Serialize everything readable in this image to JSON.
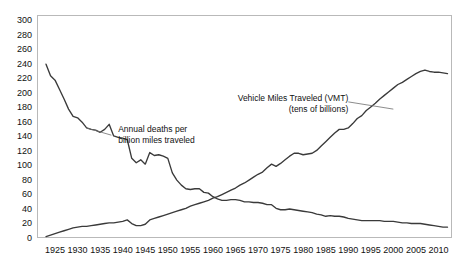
{
  "chart_data": {
    "type": "line",
    "title": "",
    "subtitle": "",
    "xlabel": "",
    "ylabel": "",
    "xlim": [
      1921,
      2013
    ],
    "ylim": [
      0,
      308
    ],
    "y_ticks": [
      0,
      20,
      40,
      60,
      80,
      100,
      120,
      140,
      160,
      180,
      200,
      220,
      240,
      260,
      280,
      300
    ],
    "x_ticks": [
      1925,
      1930,
      1935,
      1940,
      1945,
      1950,
      1955,
      1960,
      1965,
      1970,
      1975,
      1980,
      1985,
      1990,
      1995,
      2000,
      2005,
      2010
    ],
    "grid": false,
    "legend_position": "inline-annotations",
    "line_color": "#3a3a3a",
    "frame_color": "#b9b9b9",
    "background": "#ffffff",
    "annotations": [
      {
        "id": "vmt-annotation",
        "line1": "Vehicle Miles Traveled (VMT)",
        "line2": "(tens of billions)",
        "x": 1973,
        "y": 192,
        "leader_to_x": 1990,
        "leader_to_y": 186
      },
      {
        "id": "deaths-annotation",
        "line1": "Annual deaths per",
        "line2": "billion miles traveled",
        "x": 1938,
        "y": 150,
        "leader_to_x": 1933,
        "leader_to_y": 140
      }
    ],
    "series": [
      {
        "name": "Annual deaths per billion miles traveled",
        "x": [
          1923,
          1924,
          1925,
          1926,
          1927,
          1928,
          1929,
          1930,
          1931,
          1932,
          1933,
          1934,
          1935,
          1936,
          1937,
          1938,
          1939,
          1940,
          1941,
          1942,
          1943,
          1944,
          1945,
          1946,
          1947,
          1948,
          1949,
          1950,
          1951,
          1952,
          1953,
          1954,
          1955,
          1956,
          1957,
          1958,
          1959,
          1960,
          1961,
          1962,
          1963,
          1964,
          1965,
          1966,
          1967,
          1968,
          1969,
          1970,
          1971,
          1972,
          1973,
          1974,
          1975,
          1976,
          1977,
          1978,
          1979,
          1980,
          1981,
          1982,
          1983,
          1984,
          1985,
          1986,
          1987,
          1988,
          1989,
          1990,
          1991,
          1992,
          1993,
          1994,
          1995,
          1996,
          1997,
          1998,
          1999,
          2000,
          2001,
          2002,
          2003,
          2004,
          2005,
          2006,
          2007,
          2008,
          2009,
          2010,
          2011,
          2012
        ],
        "values": [
          240,
          224,
          218,
          205,
          192,
          178,
          168,
          166,
          160,
          152,
          150,
          149,
          146,
          150,
          157,
          141,
          139,
          138,
          136,
          110,
          104,
          108,
          102,
          118,
          114,
          115,
          113,
          110,
          90,
          80,
          73,
          68,
          67,
          68,
          68,
          63,
          62,
          57,
          54,
          52,
          52,
          53,
          53,
          52,
          50,
          50,
          49,
          49,
          48,
          46,
          46,
          41,
          39,
          39,
          40,
          39,
          38,
          37,
          36,
          35,
          33,
          32,
          30,
          31,
          30,
          30,
          29,
          27,
          26,
          25,
          24,
          24,
          24,
          24,
          24,
          23,
          23,
          23,
          22,
          21,
          21,
          20,
          20,
          20,
          19,
          18,
          17,
          16,
          15,
          15
        ]
      },
      {
        "name": "Vehicle Miles Traveled (VMT) (tens of billions)",
        "x": [
          1923,
          1924,
          1925,
          1926,
          1927,
          1928,
          1929,
          1930,
          1931,
          1932,
          1933,
          1934,
          1935,
          1936,
          1937,
          1938,
          1939,
          1940,
          1941,
          1942,
          1943,
          1944,
          1945,
          1946,
          1947,
          1948,
          1949,
          1950,
          1951,
          1952,
          1953,
          1954,
          1955,
          1956,
          1957,
          1958,
          1959,
          1960,
          1961,
          1962,
          1963,
          1964,
          1965,
          1966,
          1967,
          1968,
          1969,
          1970,
          1971,
          1972,
          1973,
          1974,
          1975,
          1976,
          1977,
          1978,
          1979,
          1980,
          1981,
          1982,
          1983,
          1984,
          1985,
          1986,
          1987,
          1988,
          1989,
          1990,
          1991,
          1992,
          1993,
          1994,
          1995,
          1996,
          1997,
          1998,
          1999,
          2000,
          2001,
          2002,
          2003,
          2004,
          2005,
          2006,
          2007,
          2008,
          2009,
          2010,
          2011,
          2012
        ],
        "values": [
          2,
          4,
          6,
          8,
          10,
          12,
          14,
          15,
          16,
          16,
          17,
          18,
          19,
          20,
          21,
          21,
          22,
          23,
          25,
          20,
          17,
          17,
          19,
          25,
          27,
          29,
          31,
          33,
          35,
          37,
          39,
          41,
          44,
          46,
          48,
          50,
          52,
          55,
          57,
          60,
          63,
          66,
          69,
          73,
          76,
          80,
          84,
          88,
          91,
          97,
          102,
          99,
          103,
          108,
          113,
          117,
          117,
          115,
          116,
          117,
          121,
          127,
          133,
          139,
          145,
          150,
          150,
          152,
          158,
          165,
          169,
          176,
          181,
          186,
          192,
          197,
          202,
          207,
          212,
          215,
          219,
          223,
          227,
          230,
          232,
          230,
          229,
          229,
          228,
          227
        ]
      }
    ]
  },
  "axis": {
    "y_tick_labels": [
      "300",
      "280",
      "260",
      "240",
      "220",
      "200",
      "180",
      "160",
      "140",
      "120",
      "100",
      "80",
      "60",
      "40",
      "20",
      "0"
    ],
    "x_tick_labels": [
      "1925",
      "1930",
      "1935",
      "1940",
      "1945",
      "1950",
      "1955",
      "1960",
      "1965",
      "1970",
      "1975",
      "1980",
      "1985",
      "1990",
      "1995",
      "2000",
      "2005",
      "2010"
    ]
  }
}
